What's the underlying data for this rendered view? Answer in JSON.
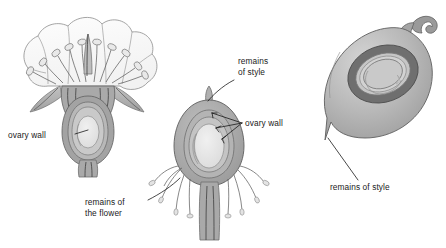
{
  "figure": {
    "kind": "botanical-diagram",
    "background_color": "#ffffff",
    "ink_color": "#1a1a1a"
  },
  "palette": {
    "petal_fill": "#fbfbfb",
    "petal_outline": "#8d8d8d",
    "sepal_fill": "#b4b4b4",
    "receptacle_fill": "#a9a9a9",
    "ovary_wall_fill": "#a3a3a3",
    "ovary_inner_fill": "#c2c2c2",
    "seed_fill": "#e6e6e6",
    "ring_dark": "#6f6f6f",
    "fruit_fill": "#b0b0b0",
    "fruit_highlight": "#d2d2d2",
    "style_hook_fill": "#9a9a9a",
    "withered_fill": "#dcdcdc",
    "stamen_fill": "#e3e3e3"
  },
  "panels": [
    {
      "id": "flower",
      "name": "open-flower-cross-section",
      "stage": "left",
      "description": "open flower in longitudinal section with petals, stamens, sepals and ovary"
    },
    {
      "id": "young-fruit",
      "name": "young-fruit-cross-section",
      "stage": "middle",
      "description": "developing fruit in longitudinal section with remains of flower attached"
    },
    {
      "id": "mature-fruit",
      "name": "mature-fruit-cross-section",
      "stage": "right",
      "description": "mature fruit in section showing seed and remains of style"
    }
  ],
  "labels": [
    {
      "id": "ovary-wall-flower",
      "text": "ovary wall",
      "lines": [
        "ovary wall"
      ],
      "x": 8,
      "y": 135,
      "anchor": "start",
      "panel": "flower"
    },
    {
      "id": "remains-of-style-middle",
      "text": "remains of style",
      "lines": [
        "remains",
        "of style"
      ],
      "x": 238,
      "y": 64,
      "anchor": "start",
      "panel": "young-fruit"
    },
    {
      "id": "ovary-wall-fruit",
      "text": "ovary wall",
      "lines": [
        "ovary wall"
      ],
      "x": 245,
      "y": 126,
      "anchor": "start",
      "panel": "young-fruit"
    },
    {
      "id": "remains-of-the-flower",
      "text": "remains of the flower",
      "lines": [
        "remains of",
        "the flower"
      ],
      "x": 85,
      "y": 207,
      "anchor": "start",
      "panel": "young-fruit"
    },
    {
      "id": "remains-of-style-right",
      "text": "remains of style",
      "lines": [
        "remains of style"
      ],
      "x": 330,
      "y": 187,
      "anchor": "start",
      "panel": "mature-fruit"
    }
  ]
}
